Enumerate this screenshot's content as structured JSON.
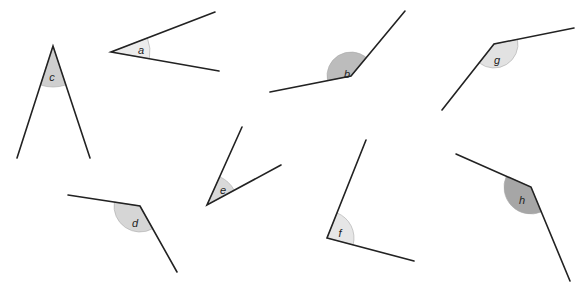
{
  "diagram": {
    "title": "",
    "angles": [
      {
        "label": "a",
        "vertex": [
          111,
          52
        ],
        "ray1": [
          215,
          12
        ],
        "ray2": [
          219,
          71
        ],
        "radius": 39,
        "fill": "#ececec",
        "label_pos": [
          141,
          50
        ]
      },
      {
        "label": "b",
        "vertex": [
          351,
          76
        ],
        "ray1": [
          405,
          11
        ],
        "ray2": [
          270,
          92
        ],
        "radius": 24,
        "fill": "#bcbcbc",
        "label_pos": [
          347,
          74
        ]
      },
      {
        "label": "c",
        "vertex": [
          53,
          46
        ],
        "ray1": [
          17,
          158
        ],
        "ray2": [
          90,
          158
        ],
        "radius": 41,
        "fill": "#cfcfcf",
        "label_pos": [
          52,
          77
        ]
      },
      {
        "label": "d",
        "vertex": [
          140,
          206
        ],
        "ray1": [
          68,
          195
        ],
        "ray2": [
          177,
          272
        ],
        "radius": 26,
        "fill": "#d6d6d6",
        "label_pos": [
          135,
          223
        ]
      },
      {
        "label": "e",
        "vertex": [
          207,
          205
        ],
        "ray1": [
          242,
          127
        ],
        "ray2": [
          281,
          165
        ],
        "radius": 31,
        "fill": "#d9d9d9",
        "label_pos": [
          223,
          190
        ]
      },
      {
        "label": "f",
        "vertex": [
          327,
          238
        ],
        "ray1": [
          366,
          140
        ],
        "ray2": [
          414,
          261
        ],
        "radius": 27,
        "fill": "#e6e6e6",
        "label_pos": [
          340,
          233
        ]
      },
      {
        "label": "g",
        "vertex": [
          494,
          44
        ],
        "ray1": [
          574,
          28
        ],
        "ray2": [
          442,
          110
        ],
        "radius": 24,
        "fill": "#e2e2e2",
        "label_pos": [
          497,
          60
        ]
      },
      {
        "label": "h",
        "vertex": [
          531,
          187
        ],
        "ray1": [
          456,
          154
        ],
        "ray2": [
          570,
          281
        ],
        "radius": 27,
        "fill": "#a6a6a6",
        "label_pos": [
          522,
          200
        ]
      }
    ]
  }
}
